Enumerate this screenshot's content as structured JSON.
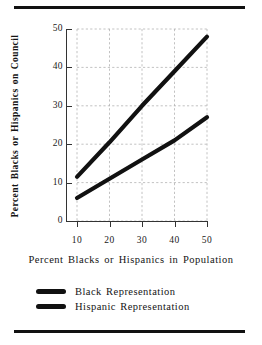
{
  "figure": {
    "top_rule": "horizontal-rule",
    "bottom_rule": "horizontal-rule"
  },
  "chart_data": {
    "type": "line",
    "title": "",
    "xlabel": "Percent Blacks or Hispanics in Population",
    "ylabel": "Percent Blacks or Hispanics on Council",
    "xlim": [
      10,
      50
    ],
    "ylim": [
      0,
      50
    ],
    "xticks": [
      10,
      20,
      30,
      40,
      50
    ],
    "yticks": [
      0,
      10,
      20,
      30,
      40,
      50
    ],
    "xtick_labels": [
      "10",
      "20",
      "30",
      "40",
      "50"
    ],
    "ytick_labels": [
      "0",
      "10",
      "20",
      "30",
      "40",
      "50"
    ],
    "grid": true,
    "grid_style": "dashed",
    "legend_position": "below",
    "x": [
      10,
      20,
      30,
      40,
      50
    ],
    "series": [
      {
        "name": "Black Representation",
        "color": "#111111",
        "values": [
          11.5,
          20.5,
          30.0,
          39.0,
          48.0
        ]
      },
      {
        "name": "Hispanic Representation",
        "color": "#111111",
        "values": [
          6.0,
          11.0,
          16.0,
          21.0,
          27.0
        ]
      }
    ]
  },
  "legend": {
    "items": [
      {
        "label": "Black Representation",
        "swatch": "line-swatch-black"
      },
      {
        "label": "Hispanic Representation",
        "swatch": "line-swatch-hispanic"
      }
    ]
  }
}
